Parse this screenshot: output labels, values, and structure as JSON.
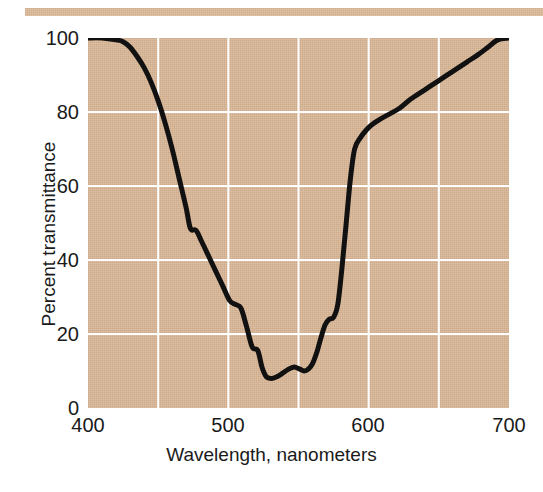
{
  "figure": {
    "background_color": "#ffffff",
    "plot_background_color": "#d6b595",
    "gridline_color": "#ffffff",
    "curve_color": "#111111",
    "top_rule_color": "#d9b896"
  },
  "axes": {
    "x": {
      "title": "Wavelength, nanometers",
      "min": 400,
      "max": 700,
      "tick_labels": [
        "400",
        "500",
        "600",
        "700"
      ],
      "tick_values": [
        400,
        500,
        600,
        700
      ],
      "gridline_values": [
        450,
        500,
        550,
        600,
        650
      ]
    },
    "y": {
      "title": "Percent transmittance",
      "min": 0,
      "max": 100,
      "tick_labels": [
        "0",
        "20",
        "40",
        "60",
        "80",
        "100"
      ],
      "tick_values": [
        0,
        20,
        40,
        60,
        80,
        100
      ],
      "gridline_values": [
        20,
        40,
        60,
        80
      ]
    }
  },
  "chart_data": {
    "type": "line",
    "title": "",
    "xlabel": "Wavelength, nanometers",
    "ylabel": "Percent transmittance",
    "xlim": [
      400,
      700
    ],
    "ylim": [
      0,
      100
    ],
    "grid": true,
    "legend": "none",
    "series": [
      {
        "name": "Percent transmittance",
        "x": [
          400,
          410,
          420,
          425,
          430,
          435,
          440,
          445,
          450,
          455,
          460,
          465,
          470,
          473,
          477,
          481,
          486,
          491,
          496,
          501,
          505,
          509,
          513,
          517,
          521,
          524,
          527,
          531,
          535,
          539,
          543,
          546,
          548,
          551,
          554,
          557,
          560,
          563,
          566,
          569,
          572,
          575,
          578,
          581,
          584,
          587,
          590,
          594,
          598,
          602,
          608,
          615,
          622,
          630,
          640,
          650,
          660,
          670,
          678,
          685,
          692,
          700
        ],
        "y": [
          100,
          100,
          99.5,
          99,
          97.5,
          95,
          92,
          88,
          83,
          77,
          70,
          62,
          54,
          48.5,
          48,
          45,
          41,
          37,
          33,
          29,
          28,
          27,
          22,
          16.5,
          15.5,
          11,
          8.5,
          8,
          8.5,
          9.5,
          10.5,
          11,
          11,
          10.5,
          10,
          10.5,
          12,
          15,
          19,
          22.5,
          24,
          24.5,
          28,
          38,
          50,
          62,
          70,
          73,
          75,
          76.5,
          78,
          79.5,
          81,
          83.5,
          86,
          88.5,
          91,
          93.5,
          95.5,
          97.5,
          99.5,
          100
        ],
        "color": "#111111",
        "line_width": 5
      }
    ]
  }
}
